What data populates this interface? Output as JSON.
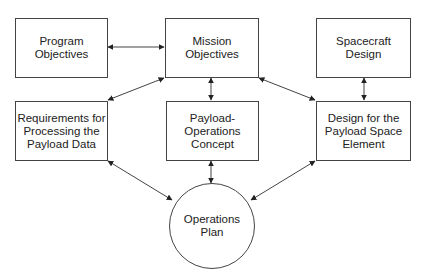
{
  "diagram": {
    "type": "flowchart",
    "nodes": {
      "program_objectives": {
        "lines": [
          "Program",
          "Objectives"
        ],
        "shape": "rectangle"
      },
      "mission_objectives": {
        "lines": [
          "Mission",
          "Objectives"
        ],
        "shape": "rectangle"
      },
      "spacecraft_design": {
        "lines": [
          "Spacecraft",
          "Design"
        ],
        "shape": "rectangle"
      },
      "requirements_processing": {
        "lines": [
          "Requirements for",
          "Processing the",
          "Payload Data"
        ],
        "shape": "rectangle"
      },
      "payload_operations_concept": {
        "lines": [
          "Payload-",
          "Operations",
          "Concept"
        ],
        "shape": "rectangle"
      },
      "design_payload_space_element": {
        "lines": [
          "Design for the",
          "Payload Space",
          "Element"
        ],
        "shape": "rectangle"
      },
      "operations_plan": {
        "lines": [
          "Operations",
          "Plan"
        ],
        "shape": "circle"
      }
    },
    "edges": [
      {
        "from": "Program Objectives",
        "to": "Mission Objectives",
        "direction": "bidirectional"
      },
      {
        "from": "Mission Objectives",
        "to": "Requirements for Processing the Payload Data",
        "direction": "bidirectional"
      },
      {
        "from": "Mission Objectives",
        "to": "Payload-Operations Concept",
        "direction": "bidirectional"
      },
      {
        "from": "Mission Objectives",
        "to": "Design for the Payload Space Element",
        "direction": "bidirectional"
      },
      {
        "from": "Spacecraft Design",
        "to": "Design for the Payload Space Element",
        "direction": "bidirectional"
      },
      {
        "from": "Requirements for Processing the Payload Data",
        "to": "Operations Plan",
        "direction": "bidirectional"
      },
      {
        "from": "Payload-Operations Concept",
        "to": "Operations Plan",
        "direction": "bidirectional"
      },
      {
        "from": "Design for the Payload Space Element",
        "to": "Operations Plan",
        "direction": "bidirectional"
      }
    ],
    "colors": {
      "stroke": "#444444",
      "text": "#222222",
      "background": "#ffffff"
    }
  }
}
